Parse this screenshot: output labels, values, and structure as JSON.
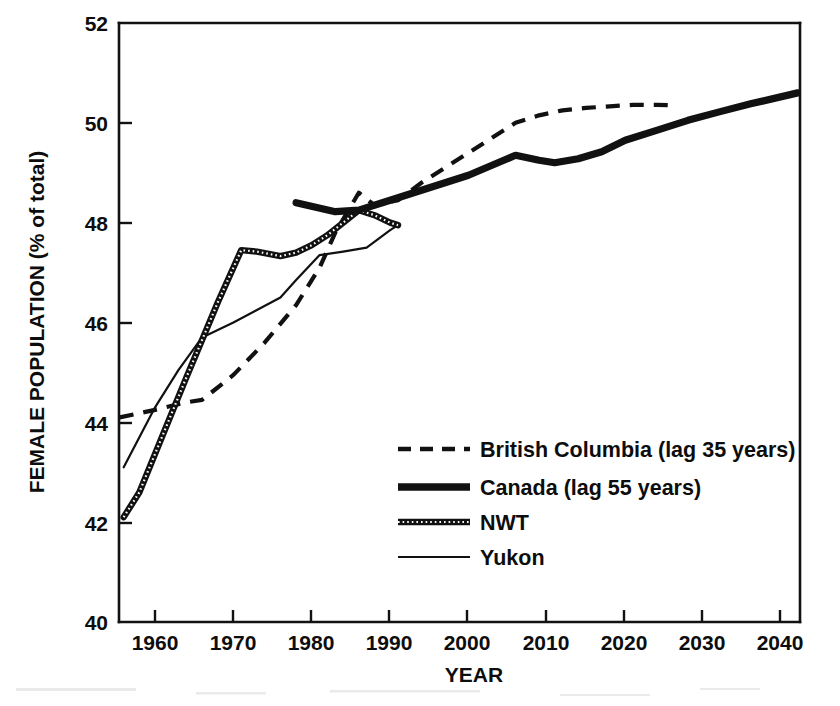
{
  "chart_data": {
    "type": "line",
    "title": "",
    "xlabel": "YEAR",
    "ylabel": "FEMALE POPULATION (% of total)",
    "xlim": [
      1955.4,
      2042.3
    ],
    "ylim": [
      40,
      52
    ],
    "xticks": [
      1960,
      1970,
      1980,
      1990,
      2000,
      2010,
      2020,
      2030,
      2040
    ],
    "xtick_labels": [
      "1960",
      "1970",
      "1980",
      "1990",
      "2000",
      "2010",
      "2020",
      "2030",
      "2040"
    ],
    "yticks": [
      40,
      42,
      44,
      46,
      48,
      50,
      52
    ],
    "ytick_labels": [
      "40",
      "42",
      "44",
      "46",
      "48",
      "50",
      "52"
    ],
    "grid": false,
    "legend_position": "lower-right-inside",
    "series": [
      {
        "name": "British Columbia (lag 35 years)",
        "style": "dashed",
        "x": [
          1955.5,
          1960,
          1964,
          1966,
          1970,
          1974,
          1978,
          1981,
          1983,
          1986,
          1988,
          1991,
          1994,
          1997,
          2000,
          2003,
          2006,
          2009,
          2012,
          2015,
          2018,
          2021,
          2024,
          2026
        ],
        "y": [
          44.1,
          44.25,
          44.4,
          44.45,
          44.95,
          45.6,
          46.35,
          47.1,
          47.8,
          48.6,
          48.35,
          48.45,
          48.8,
          49.1,
          49.4,
          49.7,
          50.0,
          50.15,
          50.25,
          50.3,
          50.33,
          50.36,
          50.36,
          50.35
        ]
      },
      {
        "name": "Canada (lag 55 years)",
        "style": "thick-solid",
        "x": [
          1978,
          1983,
          1986,
          1989,
          1992,
          1996,
          2000,
          2003,
          2006,
          2009,
          2011,
          2014,
          2017,
          2020,
          2024,
          2028,
          2032,
          2036,
          2042
        ],
        "y": [
          48.4,
          48.22,
          48.25,
          48.4,
          48.55,
          48.75,
          48.95,
          49.15,
          49.35,
          49.25,
          49.2,
          49.28,
          49.42,
          49.65,
          49.85,
          50.05,
          50.22,
          50.38,
          50.6
        ]
      },
      {
        "name": "NWT",
        "style": "thick-dotted",
        "x": [
          1956,
          1958,
          1961,
          1964,
          1966,
          1968,
          1971,
          1973,
          1976,
          1978,
          1980,
          1982,
          1984,
          1986,
          1988,
          1990,
          1991
        ],
        "y": [
          42.1,
          42.6,
          43.75,
          44.9,
          45.65,
          46.4,
          47.45,
          47.42,
          47.33,
          47.4,
          47.55,
          47.75,
          48.0,
          48.25,
          48.15,
          48.0,
          47.95
        ]
      },
      {
        "name": "Yukon",
        "style": "thin-solid",
        "x": [
          1956,
          1960,
          1963,
          1966,
          1970,
          1973,
          1976,
          1978,
          1981,
          1984,
          1987,
          1990,
          1991
        ],
        "y": [
          43.1,
          44.3,
          45.05,
          45.7,
          46.0,
          46.25,
          46.5,
          46.85,
          47.35,
          47.42,
          47.5,
          47.85,
          47.95
        ]
      }
    ]
  },
  "axes": {
    "y_axis_title": "FEMALE POPULATION (% of total)",
    "x_axis_title": "YEAR"
  },
  "legend": {
    "entries": [
      {
        "label": "British Columbia (lag 35 years)",
        "style": "dashed"
      },
      {
        "label": "Canada (lag 55 years)",
        "style": "thick-solid"
      },
      {
        "label": "NWT",
        "style": "thick-dotted"
      },
      {
        "label": "Yukon",
        "style": "thin-solid"
      }
    ]
  },
  "colors": {
    "ink": "#111111",
    "background": "#ffffff"
  }
}
